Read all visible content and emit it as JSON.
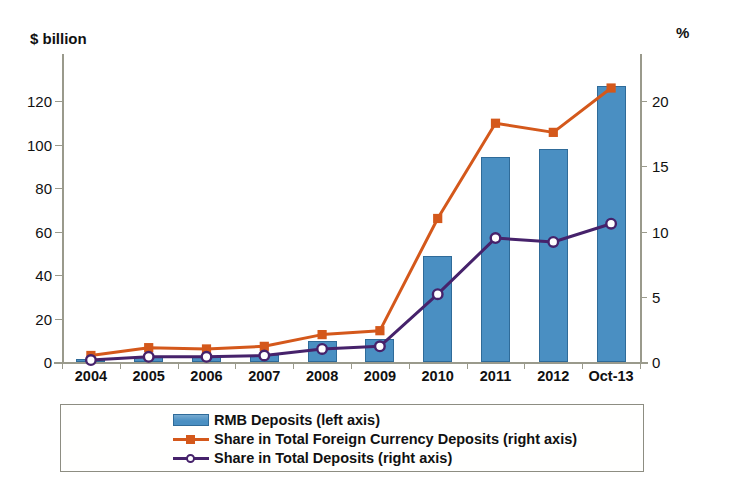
{
  "chart_data": {
    "type": "bar",
    "title": "",
    "xlabel": "",
    "categories": [
      "2004",
      "2005",
      "2006",
      "2007",
      "2008",
      "2009",
      "2010",
      "2011",
      "2012",
      "Oct-13"
    ],
    "left_axis": {
      "label": "$ billion",
      "ylim": [
        0,
        140
      ],
      "ticks": [
        0,
        20,
        40,
        60,
        80,
        100,
        120
      ],
      "tick_labels": [
        "0",
        "20",
        "40",
        "60",
        "80",
        "100",
        "120"
      ]
    },
    "right_axis": {
      "label": "%",
      "ylim": [
        0,
        23.3
      ],
      "ticks": [
        0,
        5,
        10,
        15,
        20
      ],
      "tick_labels": [
        "0",
        "5",
        "10",
        "15",
        "20"
      ]
    },
    "grid": false,
    "legend_position": "below-plot",
    "series": [
      {
        "name": "RMB Deposits (left axis)",
        "type": "bar",
        "axis": "left",
        "color": "#4a8fc2",
        "border_color": "#2f6b99",
        "values": [
          1.2,
          2.2,
          2.5,
          3.3,
          9.5,
          10.5,
          48.9,
          94.5,
          98.0,
          127.0
        ]
      },
      {
        "name": "Share in Total Foreign Currency Deposits (right axis)",
        "type": "line",
        "axis": "right",
        "color": "#d4581b",
        "marker": "square",
        "values": [
          0.5,
          1.1,
          1.0,
          1.2,
          2.1,
          2.4,
          11.0,
          18.3,
          17.6,
          21.0
        ]
      },
      {
        "name": "Share in Total Deposits (right axis)",
        "type": "line",
        "axis": "right",
        "color": "#46226b",
        "marker": "open-circle",
        "values": [
          0.15,
          0.4,
          0.4,
          0.5,
          1.0,
          1.2,
          5.2,
          9.5,
          9.2,
          10.6
        ]
      }
    ]
  }
}
